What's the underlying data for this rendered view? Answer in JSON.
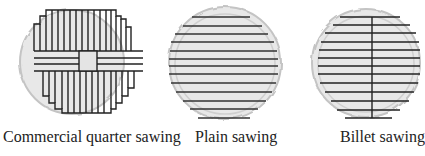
{
  "diagrams": [
    {
      "id": "commercial-quarter",
      "caption": "Commercial quarter sawing",
      "log": {
        "cx": 72,
        "cy": 62,
        "r": 52
      },
      "colors": {
        "log_fill": "#e6e6e6",
        "log_stroke": "#c8c8c8",
        "line": "#222222"
      }
    },
    {
      "id": "plain",
      "caption": "Plain sawing",
      "log": {
        "cx": 225,
        "cy": 63,
        "r": 56
      },
      "colors": {
        "log_fill": "#e6e6e6",
        "log_stroke": "#c8c8c8",
        "line": "#222222"
      }
    },
    {
      "id": "billet",
      "caption": "Billet sawing",
      "log": {
        "cx": 366,
        "cy": 63,
        "r": 54
      },
      "colors": {
        "log_fill": "#e6e6e6",
        "log_stroke": "#c8c8c8",
        "line": "#222222"
      }
    }
  ]
}
